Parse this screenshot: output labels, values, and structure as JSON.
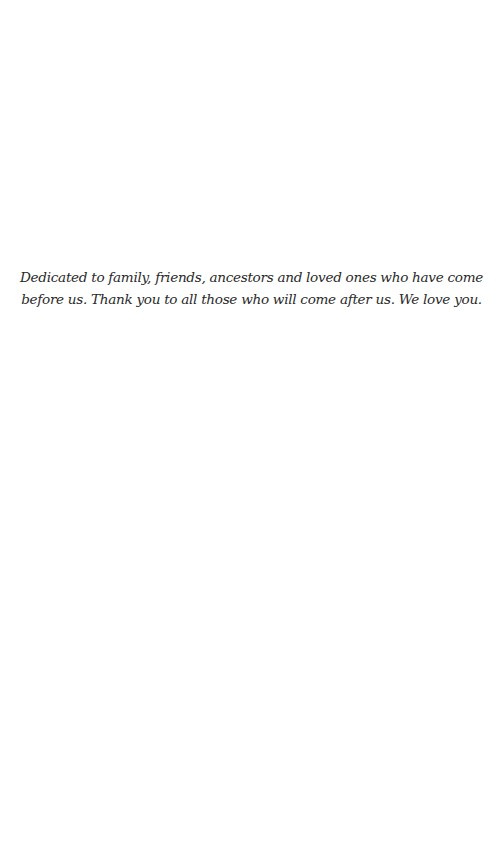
{
  "page": {
    "background": "#ffffff",
    "text_color": "#2a2a2a"
  },
  "dedication": {
    "lines": [
      "Dedicated to family, friends, ancestors and loved ones who have come",
      "before us. Thank you to all those who will come after us. We love you."
    ]
  }
}
